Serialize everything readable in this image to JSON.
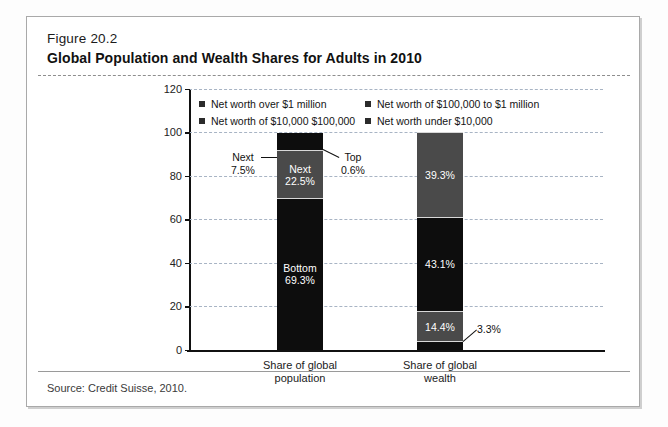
{
  "figure": {
    "label": "Figure 20.2",
    "title": "Global Population and Wealth Shares for Adults in 2010",
    "source": "Source: Credit Suisse, 2010."
  },
  "colors": {
    "black": "#0d0d0d",
    "dark_gray": "#2b2b2b",
    "mid_gray": "#4a4a4a",
    "light_gray": "#6e6e6e",
    "gridline": "#a8b4c4",
    "frame": "#a9a9a9"
  },
  "legend": {
    "items": [
      {
        "label": "Net worth over $1 million",
        "swatch": "#2b2b2b"
      },
      {
        "label": "Net worth of $100,000 to $1 million",
        "swatch": "#2b2b2b"
      },
      {
        "label": "Net worth of $10,000 $100,000",
        "swatch": "#2b2b2b"
      },
      {
        "label": "Net worth under $10,000",
        "swatch": "#2b2b2b"
      }
    ]
  },
  "callouts": {
    "next_line1": "Next",
    "next_line2": "7.5%",
    "top_line1": "Top",
    "top_line2": "0.6%",
    "wealth_small": "3.3%"
  },
  "yticks": [
    "0",
    "20",
    "40",
    "60",
    "80",
    "100",
    "120"
  ],
  "chart_data": {
    "type": "bar",
    "title": "Global Population and Wealth Shares for Adults in 2010",
    "subtitle": "Figure 20.2",
    "xlabel": "",
    "ylabel": "",
    "ylim": [
      0,
      120
    ],
    "ytick_step": 20,
    "grid": true,
    "stacked": true,
    "legend_position": "inside-top",
    "categories": [
      "Share of global population",
      "Share of global wealth"
    ],
    "series": [
      {
        "name": "Net worth over $1 million",
        "color": "#0d0d0d",
        "values": [
          0.6,
          39.3
        ],
        "labels": [
          "0.6%",
          "39.3%"
        ]
      },
      {
        "name": "Net worth of $100,000 to $1 million",
        "color": "#0d0d0d",
        "values": [
          7.5,
          43.1
        ],
        "labels": [
          "7.5%",
          "43.1%"
        ]
      },
      {
        "name": "Net worth of $10,000 $100,000",
        "color": "#4a4a4a",
        "values": [
          22.5,
          14.4
        ],
        "labels": [
          "22.5%",
          "14.4%"
        ]
      },
      {
        "name": "Net worth under $10,000",
        "color": "#0d0d0d",
        "values": [
          69.3,
          3.3
        ],
        "labels": [
          "69.3%",
          "3.3%"
        ]
      }
    ],
    "bars": [
      {
        "category": "Share of global population",
        "category_line1": "Share of global",
        "category_line2": "population",
        "total": 100,
        "segments": [
          {
            "name": "Top",
            "value": 0.6,
            "label_line1": "Top",
            "label_line2": "0.6%",
            "color": "#0d0d0d",
            "label_inside": false
          },
          {
            "name": "Next",
            "value": 7.5,
            "label_line1": "Next",
            "label_line2": "7.5%",
            "color": "#0d0d0d",
            "label_inside": false
          },
          {
            "name": "Next",
            "value": 22.5,
            "label_line1": "Next",
            "label_line2": "22.5%",
            "color": "#4a4a4a",
            "label_inside": true
          },
          {
            "name": "Bottom",
            "value": 69.3,
            "label_line1": "Bottom",
            "label_line2": "69.3%",
            "color": "#0d0d0d",
            "label_inside": true
          }
        ]
      },
      {
        "category": "Share of global wealth",
        "category_line1": "Share of global",
        "category_line2": "wealth",
        "total": 100,
        "segments": [
          {
            "name": "Top",
            "value": 39.3,
            "label_line1": "",
            "label_line2": "39.3%",
            "color": "#4a4a4a",
            "label_inside": true
          },
          {
            "name": "Next",
            "value": 43.1,
            "label_line1": "",
            "label_line2": "43.1%",
            "color": "#0d0d0d",
            "label_inside": true
          },
          {
            "name": "Next",
            "value": 14.4,
            "label_line1": "",
            "label_line2": "14.4%",
            "color": "#4a4a4a",
            "label_inside": true
          },
          {
            "name": "Bottom",
            "value": 3.3,
            "label_line1": "",
            "label_line2": "3.3%",
            "color": "#0d0d0d",
            "label_inside": false
          }
        ]
      }
    ]
  }
}
